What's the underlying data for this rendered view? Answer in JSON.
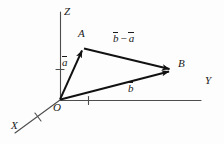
{
  "figure": {
    "background_color": "#fdfdfd",
    "ink_color": "#1a1a1a",
    "width": 224,
    "height": 144
  },
  "axes": [
    {
      "name": "x-axis",
      "label": "X",
      "label_x": 11,
      "label_y": 126,
      "tick_count": 1
    },
    {
      "name": "y-axis",
      "label": "Y",
      "label_x": 205,
      "label_y": 81,
      "tick_count": 1
    },
    {
      "name": "z-axis",
      "label": "Z",
      "label_x": 64,
      "label_y": 8,
      "tick_count": 1
    }
  ],
  "points": [
    {
      "name": "origin",
      "label": "O",
      "label_x": 53,
      "label_y": 103,
      "x": 60,
      "y": 100
    },
    {
      "name": "point-a",
      "label": "A",
      "label_x": 78,
      "label_y": 29,
      "x": 83,
      "y": 48
    },
    {
      "name": "point-b",
      "label": "B",
      "label_x": 178,
      "label_y": 59,
      "x": 172,
      "y": 70
    }
  ],
  "vectors": [
    {
      "name": "vector-a",
      "symbol": "a",
      "notation": "overbar",
      "from": "O",
      "to": "A",
      "label_x": 62,
      "label_y": 58
    },
    {
      "name": "vector-b",
      "symbol": "b",
      "notation": "overbar",
      "from": "O",
      "to": "B",
      "label_x": 128,
      "label_y": 84
    },
    {
      "name": "vector-b-minus-a",
      "symbol_left": "b",
      "operator": "−",
      "symbol_right": "a",
      "notation": "overbar",
      "from": "A",
      "to": "B",
      "label_x": 113,
      "label_y": 33
    }
  ]
}
